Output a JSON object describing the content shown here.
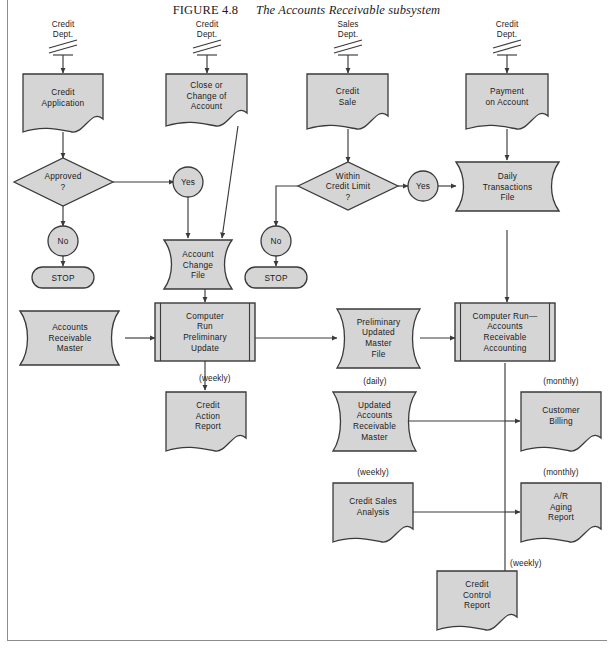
{
  "figure": {
    "number": "FIGURE 4.8",
    "title": "The Accounts Receivable subsystem",
    "fill_color": "#d5d5d5",
    "stroke_color": "#3a3a3a",
    "page_background": "#ffffff"
  },
  "sources": [
    {
      "id": "src-credit-dept-1",
      "label": "Credit\nDept."
    },
    {
      "id": "src-credit-dept-2",
      "label": "Credit\nDept."
    },
    {
      "id": "src-sales-dept",
      "label": "Sales\nDept."
    },
    {
      "id": "src-credit-dept-3",
      "label": "Credit\nDept."
    }
  ],
  "documents": [
    {
      "id": "doc-credit-application",
      "label": "Credit\nApplication"
    },
    {
      "id": "doc-close-change-account",
      "label": "Close or\nChange of\nAccount"
    },
    {
      "id": "doc-credit-sale",
      "label": "Credit\nSale"
    },
    {
      "id": "doc-payment-on-account",
      "label": "Payment\non Account"
    },
    {
      "id": "doc-credit-action-report",
      "label": "Credit\nAction\nReport"
    },
    {
      "id": "doc-customer-billing",
      "label": "Customer\nBilling"
    },
    {
      "id": "doc-credit-sales-analysis",
      "label": "Credit Sales\nAnalysis"
    },
    {
      "id": "doc-ar-aging-report",
      "label": "A/R\nAging\nReport"
    },
    {
      "id": "doc-credit-control-report",
      "label": "Credit\nControl\nReport"
    }
  ],
  "decisions": [
    {
      "id": "dec-approved",
      "label": "Approved\n?"
    },
    {
      "id": "dec-within-credit-limit",
      "label": "Within\nCredit Limit\n?"
    }
  ],
  "connectors": [
    {
      "id": "conn-no-1",
      "label": "No"
    },
    {
      "id": "conn-yes-1",
      "label": "Yes"
    },
    {
      "id": "conn-no-2",
      "label": "No"
    },
    {
      "id": "conn-yes-2",
      "label": "Yes"
    }
  ],
  "terminators": [
    {
      "id": "term-stop-1",
      "label": "STOP"
    },
    {
      "id": "term-stop-2",
      "label": "STOP"
    }
  ],
  "files": [
    {
      "id": "file-account-change",
      "label": "Account\nChange\nFile"
    },
    {
      "id": "file-daily-transactions",
      "label": "Daily\nTransactions\nFile"
    },
    {
      "id": "file-accounts-receivable-master",
      "label": "Accounts\nReceivable\nMaster"
    },
    {
      "id": "file-preliminary-updated-master",
      "label": "Preliminary\nUpdated\nMaster\nFile"
    },
    {
      "id": "file-updated-ar-master",
      "label": "Updated\nAccounts\nReceivable\nMaster"
    }
  ],
  "processes": [
    {
      "id": "proc-preliminary-update",
      "label": "Computer\nRun\nPreliminary\nUpdate"
    },
    {
      "id": "proc-ar-accounting",
      "label": "Computer Run—\nAccounts\nReceivable\nAccounting"
    }
  ],
  "frequency_labels": [
    {
      "id": "freq-weekly-credit-action",
      "label": "(weekly)"
    },
    {
      "id": "freq-daily-updated-master",
      "label": "(daily)"
    },
    {
      "id": "freq-monthly-customer-billing",
      "label": "(monthly)"
    },
    {
      "id": "freq-weekly-credit-sales",
      "label": "(weekly)"
    },
    {
      "id": "freq-monthly-ar-aging",
      "label": "(monthly)"
    },
    {
      "id": "freq-weekly-credit-control",
      "label": "(weekly)"
    }
  ]
}
